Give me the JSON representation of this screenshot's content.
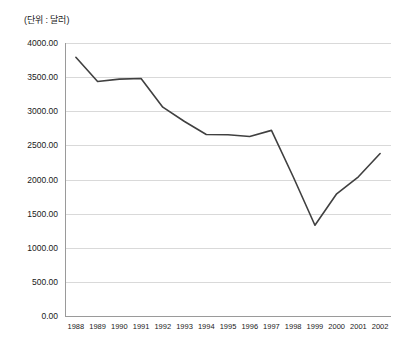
{
  "unit_label": "(단위 : 달러)",
  "colors": {
    "line": "#404040",
    "grid": "#d9d9d9",
    "axis": "#9a9a9a",
    "text": "#1a1a1a",
    "background": "#ffffff"
  },
  "axis": {
    "y_ticks": [
      "0.00",
      "500.00",
      "1000.00",
      "1500.00",
      "2000.00",
      "2500.00",
      "3000.00",
      "3500.00",
      "4000.00"
    ],
    "x_ticks": [
      "1988",
      "1989",
      "1990",
      "1991",
      "1992",
      "1993",
      "1994",
      "1995",
      "1996",
      "1997",
      "1998",
      "1999",
      "2000",
      "2001",
      "2002"
    ]
  },
  "chart_data": {
    "type": "line",
    "title": "",
    "subtitle": "",
    "xlabel": "",
    "ylabel": "(단위 : 달러)",
    "categories": [
      "1988",
      "1989",
      "1990",
      "1991",
      "1992",
      "1993",
      "1994",
      "1995",
      "1996",
      "1997",
      "1998",
      "1999",
      "2000",
      "2001",
      "2002"
    ],
    "values": [
      3790,
      3435,
      3470,
      3480,
      3060,
      2850,
      2660,
      2655,
      2630,
      2720,
      2040,
      1330,
      1790,
      2040,
      2380
    ],
    "series": [
      {
        "name": "",
        "values": [
          3790,
          3435,
          3470,
          3480,
          3060,
          2850,
          2660,
          2655,
          2630,
          2720,
          2040,
          1330,
          1790,
          2040,
          2380
        ]
      }
    ],
    "ylim": [
      0,
      4000
    ],
    "ytick_step": 500,
    "ytick_values": [
      0,
      500,
      1000,
      1500,
      2000,
      2500,
      3000,
      3500,
      4000
    ],
    "grid": {
      "horizontal": true,
      "vertical": false
    },
    "legend": {
      "visible": false,
      "position": "none"
    },
    "markers": false
  }
}
